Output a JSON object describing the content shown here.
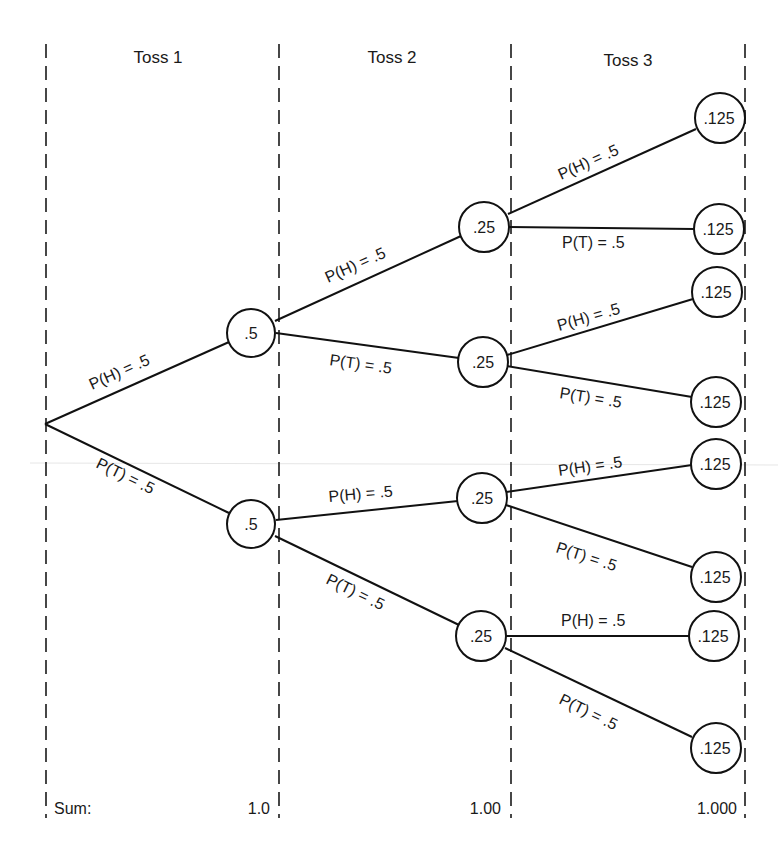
{
  "diagram": {
    "type": "probability-tree",
    "columns": [
      {
        "label": "Toss 1",
        "x": 158
      },
      {
        "label": "Toss 2",
        "x": 392
      },
      {
        "label": "Toss 3",
        "x": 628
      }
    ],
    "dividers_x": [
      46,
      279,
      511,
      745
    ],
    "root": {
      "x": 45,
      "y": 424
    },
    "nodes": {
      "t1": [
        {
          "id": "H",
          "value": ".5",
          "x": 251,
          "y": 333
        },
        {
          "id": "T",
          "value": ".5",
          "x": 251,
          "y": 524
        }
      ],
      "t2": [
        {
          "id": "HH",
          "value": ".25",
          "x": 484,
          "y": 227
        },
        {
          "id": "HT",
          "value": ".25",
          "x": 483,
          "y": 362
        },
        {
          "id": "TH",
          "value": ".25",
          "x": 482,
          "y": 498
        },
        {
          "id": "TT",
          "value": ".25",
          "x": 481,
          "y": 636
        }
      ],
      "t3": [
        {
          "id": "HHH",
          "value": ".125",
          "x": 720,
          "y": 118
        },
        {
          "id": "HHT",
          "value": ".125",
          "x": 719,
          "y": 229
        },
        {
          "id": "HTH",
          "value": ".125",
          "x": 717,
          "y": 292
        },
        {
          "id": "HTT",
          "value": ".125",
          "x": 716,
          "y": 402
        },
        {
          "id": "THH",
          "value": ".125",
          "x": 716,
          "y": 464
        },
        {
          "id": "THT",
          "value": ".125",
          "x": 716,
          "y": 577
        },
        {
          "id": "TTH",
          "value": ".125",
          "x": 714,
          "y": 636
        },
        {
          "id": "TTT",
          "value": ".125",
          "x": 716,
          "y": 748
        }
      ]
    },
    "branch_labels": {
      "heads": "P(H) = .5",
      "tails": "P(T) = .5"
    },
    "sums": {
      "label": "Sum:",
      "toss1": "1.0",
      "toss2": "1.00",
      "toss3": "1.000"
    }
  }
}
